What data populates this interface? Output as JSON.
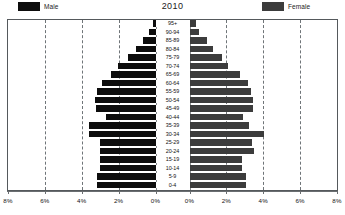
{
  "chart_data": {
    "type": "bar",
    "subtype": "population-pyramid",
    "title": "2010",
    "xlabel": "",
    "ylabel": "",
    "grid": true,
    "legend_position": "top",
    "axis": {
      "left_ticks": [
        "8%",
        "6%",
        "4%",
        "2%",
        "0%"
      ],
      "right_ticks": [
        "0%",
        "2%",
        "4%",
        "6%",
        "8%"
      ],
      "xlim": [
        0,
        8
      ],
      "tick_step": 2,
      "unit": "%"
    },
    "categories": [
      "95+",
      "90-94",
      "85-89",
      "80-84",
      "75-79",
      "70-74",
      "65-69",
      "60-64",
      "55-59",
      "50-54",
      "45-49",
      "40-44",
      "35-39",
      "30-34",
      "25-29",
      "20-24",
      "15-19",
      "10-14",
      "5-9",
      "0-4"
    ],
    "series": [
      {
        "name": "Male",
        "color": "#0d0d0d",
        "side": "left",
        "values": [
          0.15,
          0.35,
          0.7,
          1.05,
          1.5,
          2.05,
          2.4,
          2.9,
          3.2,
          3.3,
          3.25,
          2.7,
          3.6,
          3.6,
          3.0,
          3.0,
          3.0,
          3.0,
          3.2,
          3.2
        ]
      },
      {
        "name": "Female",
        "color": "#3c3c3c",
        "side": "right",
        "values": [
          0.35,
          0.5,
          0.95,
          1.3,
          1.75,
          2.1,
          2.75,
          3.15,
          3.35,
          3.45,
          3.45,
          2.9,
          3.25,
          4.05,
          3.4,
          3.5,
          2.85,
          2.85,
          3.05,
          3.05
        ]
      }
    ]
  },
  "legend": {
    "male_label": "Male",
    "female_label": "Female"
  },
  "colors": {
    "male": "#0d0d0d",
    "female": "#3c3c3c",
    "frame": "#55595c",
    "grid": "#6f7478",
    "background": "#ffffff"
  }
}
